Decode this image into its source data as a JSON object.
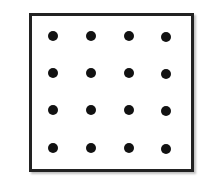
{
  "diagram": {
    "type": "dot-grid",
    "rows": 4,
    "cols": 4,
    "dot_color": "#111111",
    "border_color": "#222222",
    "dots": [
      {
        "row": 0,
        "col": 0,
        "x": 53,
        "y": 36
      },
      {
        "row": 0,
        "col": 1,
        "x": 91,
        "y": 36
      },
      {
        "row": 0,
        "col": 2,
        "x": 129,
        "y": 36
      },
      {
        "row": 0,
        "col": 3,
        "x": 166,
        "y": 37
      },
      {
        "row": 1,
        "col": 0,
        "x": 53,
        "y": 73
      },
      {
        "row": 1,
        "col": 1,
        "x": 91,
        "y": 73
      },
      {
        "row": 1,
        "col": 2,
        "x": 129,
        "y": 73
      },
      {
        "row": 1,
        "col": 3,
        "x": 166,
        "y": 74
      },
      {
        "row": 2,
        "col": 0,
        "x": 53,
        "y": 110
      },
      {
        "row": 2,
        "col": 1,
        "x": 91,
        "y": 110
      },
      {
        "row": 2,
        "col": 2,
        "x": 129,
        "y": 110
      },
      {
        "row": 2,
        "col": 3,
        "x": 166,
        "y": 111
      },
      {
        "row": 3,
        "col": 0,
        "x": 53,
        "y": 148
      },
      {
        "row": 3,
        "col": 1,
        "x": 91,
        "y": 148
      },
      {
        "row": 3,
        "col": 2,
        "x": 129,
        "y": 148
      },
      {
        "row": 3,
        "col": 3,
        "x": 166,
        "y": 149
      }
    ]
  }
}
